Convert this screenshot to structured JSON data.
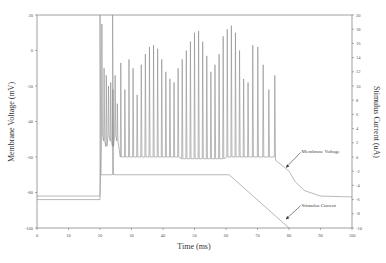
{
  "chart_data": {
    "type": "line",
    "title": "",
    "xlabel": "Time (ms)",
    "ylabel": "Membrane Voltage (mV)",
    "y2label": "Stimulus Current (uA)",
    "xlim": [
      0,
      100
    ],
    "ylim": [
      -100,
      20
    ],
    "y2lim": [
      -10,
      20
    ],
    "xticks": [
      0,
      10,
      20,
      30,
      40,
      50,
      60,
      70,
      80,
      90,
      100
    ],
    "yticks": [
      20,
      0,
      -20,
      -40,
      -60,
      -80,
      -100
    ],
    "y2ticks": [
      20,
      18,
      16,
      14,
      12,
      10,
      8,
      6,
      4,
      2,
      0,
      -2,
      -4,
      -6,
      -8,
      -10
    ],
    "grid": false,
    "colors": {
      "membrane": "#8a8a8a",
      "stimulus": "#9a9a9a",
      "axis": "#666666"
    },
    "series": [
      {
        "name": "Membrane Voltage",
        "axis": "left",
        "rest_mV": -82,
        "stim_onset_ms": 20,
        "trough_mV": -60,
        "spike_times_ms": [
          20.6,
          21.3,
          22.0,
          22.7,
          23.4,
          24.1,
          24.8,
          25.5,
          26.6,
          27.9,
          29.2,
          30.5,
          31.8,
          33.1,
          34.4,
          35.7,
          37.0,
          38.3,
          39.6,
          40.9,
          42.2,
          43.5,
          44.8,
          46.1,
          47.4,
          48.7,
          50.0,
          51.3,
          52.6,
          53.9,
          55.2,
          56.5,
          57.8,
          59.1,
          60.4,
          61.7,
          63.0,
          64.3,
          65.6,
          67.0,
          68.5,
          70.1,
          71.8,
          73.6,
          75.5
        ],
        "spike_peaks_mV": [
          15,
          -10,
          -14,
          -20,
          -18,
          -22,
          -14,
          -30,
          -7,
          -22,
          -5,
          -10,
          -25,
          -8,
          -2,
          2,
          3,
          1,
          -5,
          -12,
          -16,
          -18,
          -10,
          -5,
          0,
          5,
          10,
          11,
          5,
          -3,
          -12,
          -8,
          -2,
          8,
          12,
          14,
          10,
          0,
          -16,
          -18,
          3,
          2,
          -8,
          -22,
          -14
        ],
        "decay_points": [
          [
            75.8,
            -62
          ],
          [
            78,
            -65
          ],
          [
            80,
            -68
          ],
          [
            82,
            -74
          ],
          [
            85,
            -79
          ],
          [
            90,
            -82
          ],
          [
            100,
            -82.5
          ]
        ]
      },
      {
        "name": "Stimulus Current",
        "axis": "right",
        "points": [
          [
            0,
            -6
          ],
          [
            20,
            -6
          ],
          [
            20,
            20
          ],
          [
            20.3,
            -2.5
          ],
          [
            24,
            -2.5
          ],
          [
            24,
            20
          ],
          [
            24.3,
            -2.5
          ],
          [
            61,
            -2.5
          ],
          [
            80,
            -10
          ]
        ]
      }
    ],
    "annotations": [
      {
        "text": "Membrane Voltage",
        "arrow_to": [
          79,
          -66
        ],
        "text_at": [
          84,
          -58
        ]
      },
      {
        "text": "Stimulus Current",
        "arrow_to": [
          79,
          -8.8
        ],
        "text_at": [
          84,
          -7
        ]
      }
    ]
  }
}
